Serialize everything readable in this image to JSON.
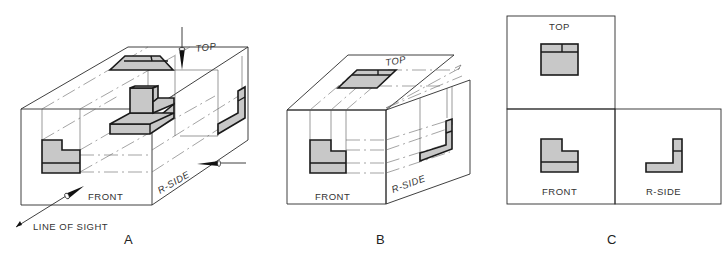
{
  "figure": {
    "panels": [
      {
        "id": "A",
        "caption": "A",
        "description": "Object inside glass box with projection planes",
        "labels": {
          "top": "TOP",
          "front": "FRONT",
          "side": "R-SIDE",
          "line_of_sight": "LINE OF SIGHT"
        }
      },
      {
        "id": "B",
        "caption": "B",
        "description": "Glass box planes unfolding",
        "labels": {
          "top": "TOP",
          "front": "FRONT",
          "side": "R-SIDE"
        }
      },
      {
        "id": "C",
        "caption": "C",
        "description": "Planes unfolded flat into orthographic views",
        "labels": {
          "top": "TOP",
          "front": "FRONT",
          "side": "R-SIDE"
        }
      }
    ],
    "colors": {
      "object_fill": "#c8c8c8",
      "object_stroke": "#1a1a1a",
      "plane_line": "#2a2a2a",
      "projection_line": "#666666"
    }
  }
}
